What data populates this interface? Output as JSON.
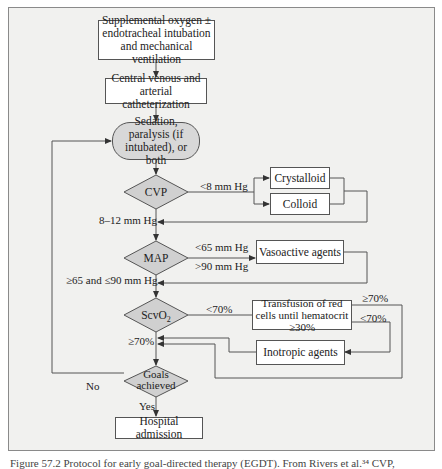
{
  "diagram": {
    "colors": {
      "background": "#f1f1ef",
      "box_fill": "#ffffff",
      "decision_fill": "#d0d0d0",
      "line": "#555555"
    },
    "nodes": {
      "start": "Supplemental oxygen ± endotracheal intubation and mechanical ventilation",
      "catheter": "Central venous and arterial catheterization",
      "sedation": "Sedation, paralysis (if intubated), or both",
      "cvp": "CVP",
      "crystalloid": "Crystalloid",
      "colloid": "Colloid",
      "map": "MAP",
      "vasoactive": "Vasoactive agents",
      "scvo2": "ScvO",
      "scvo2_sub": "2",
      "transfusion": "Transfusion of red cells until hematocrit ≥30%",
      "inotropic": "Inotropic agents",
      "goals": "Goals achieved",
      "admission": "Hospital admission"
    },
    "edge_labels": {
      "cvp_low": "<8 mm Hg",
      "cvp_ok": "8–12 mm Hg",
      "map_low": "<65 mm Hg",
      "map_high": ">90 mm Hg",
      "map_ok": "≥65 and ≤90 mm Hg",
      "scvo2_low": "<70%",
      "scvo2_ok": "≥70%",
      "transfusion_ok": "≥70%",
      "transfusion_low": "<70%",
      "goals_no": "No",
      "goals_yes": "Yes"
    },
    "caption": "Figure 57.2   Protocol for early goal-directed therapy (EGDT). From Rivers et al.³⁴ CVP,"
  }
}
